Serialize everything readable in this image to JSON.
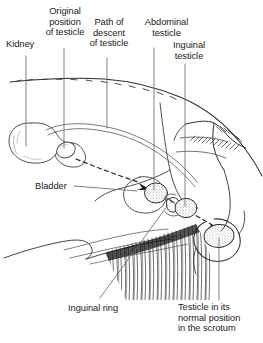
{
  "figure": {
    "kind": "anatomical-line-diagram",
    "background_color": "#ffffff",
    "ink_color": "#1b1b1b",
    "line_color": "#444444"
  },
  "labels": {
    "kidney": "Kidney",
    "original_position": "Original\nposition\nof testicle",
    "path_of_descent": "Path of\ndescent\nof testicle",
    "abdominal_testicle": "Abdominal\ntesticle",
    "inguinal_testicle": "Inguinal\ntesticle",
    "bladder": "Bladder",
    "inguinal_ring": "Inguinal ring",
    "scrotal_testicle": "Testicle in its\nnormal position\nin the scrotum"
  },
  "structures": [
    {
      "name": "kidney",
      "shape": "bean"
    },
    {
      "name": "original-testicle-position",
      "shape": "small-oval"
    },
    {
      "name": "abdominal-testicle",
      "shape": "stippled-oval"
    },
    {
      "name": "inguinal-testicle",
      "shape": "stippled-oval"
    },
    {
      "name": "scrotal-testicle",
      "shape": "stippled-oval"
    },
    {
      "name": "bladder",
      "shape": "rounded-sac"
    },
    {
      "name": "spermatic-cord",
      "shape": "double-curve"
    },
    {
      "name": "descent-path",
      "shape": "dashed-curve"
    },
    {
      "name": "scrotum",
      "shape": "pouch-outline"
    },
    {
      "name": "body-outline",
      "shape": "dorsal-and-ventral-contour"
    },
    {
      "name": "hair-coat",
      "shape": "dense-hatching"
    }
  ]
}
